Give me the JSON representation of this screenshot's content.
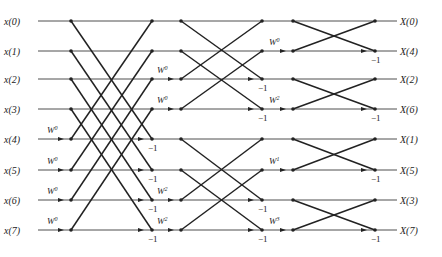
{
  "diagram": {
    "type": "8-point decimation-in-frequency FFT butterfly flow graph",
    "inputs": [
      "x(0)",
      "x(1)",
      "x(2)",
      "x(3)",
      "x(4)",
      "x(5)",
      "x(6)",
      "x(7)"
    ],
    "outputs": [
      "X(0)",
      "X(4)",
      "X(2)",
      "X(6)",
      "X(1)",
      "X(5)",
      "X(3)",
      "X(7)"
    ],
    "rows_y": [
      21,
      51,
      79,
      109,
      139,
      170,
      200,
      230
    ],
    "columns_x": [
      71,
      152,
      181,
      262,
      293,
      375
    ],
    "stage1": {
      "twiddles": [
        {
          "row": 4,
          "label": "W",
          "exp": "0"
        },
        {
          "row": 5,
          "label": "W",
          "exp": "0"
        },
        {
          "row": 6,
          "label": "W",
          "exp": "0"
        },
        {
          "row": 7,
          "label": "W",
          "exp": "0"
        }
      ],
      "neg_rows": [
        4,
        5,
        6,
        7
      ],
      "neg_label": "−1"
    },
    "stage2": {
      "twiddles": [
        {
          "row": 2,
          "label": "W",
          "exp": "0"
        },
        {
          "row": 3,
          "label": "W",
          "exp": "0"
        },
        {
          "row": 6,
          "label": "W",
          "exp": "2"
        },
        {
          "row": 7,
          "label": "W",
          "exp": "2"
        }
      ],
      "neg_rows": [
        2,
        3,
        6,
        7
      ],
      "neg_label": "−1"
    },
    "stage3": {
      "twiddles": [
        {
          "row": 1,
          "label": "W",
          "exp": "0"
        },
        {
          "row": 3,
          "label": "W",
          "exp": "2"
        },
        {
          "row": 5,
          "label": "W",
          "exp": "1"
        },
        {
          "row": 7,
          "label": "W",
          "exp": "3"
        }
      ],
      "neg_rows": [
        1,
        3,
        5,
        7
      ],
      "neg_label": "−1"
    }
  }
}
